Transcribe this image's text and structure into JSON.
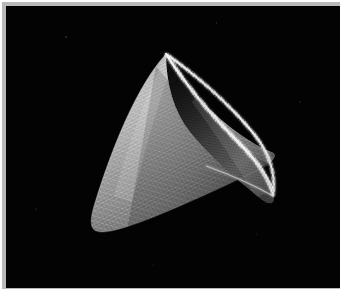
{
  "figure": {
    "background_color": "#030303",
    "plate_color": "#b9b9b9",
    "page_color": "#ffffff",
    "canvas": {
      "width": 334,
      "height": 282,
      "offset_x": 4,
      "offset_y": 4
    }
  },
  "object": {
    "name": "cone-mesh",
    "shading": "diffuse-lambert",
    "light_direction": "upper-left",
    "outer_surface": {
      "label": "outer-flank",
      "highlight_color": "#c9c9c9",
      "mid_color": "#8a8a8a",
      "shadow_color": "#3a3a3a"
    },
    "inner_surface": {
      "label": "inner-cavity",
      "highlight_color": "#6e6e6e",
      "mid_color": "#474747",
      "shadow_color": "#141414"
    },
    "rim": {
      "label": "elliptical-opening-rim",
      "color": "#e8e8e8",
      "style": "serrated-wireframe"
    },
    "geometry": {
      "apex_x": 160,
      "apex_y": 48,
      "lower_tip_x": 85,
      "lower_tip_y": 224,
      "right_tip_x": 266,
      "right_tip_y": 195,
      "rim_center_x": 213,
      "rim_center_y": 122,
      "rim_radius_x": 56,
      "rim_radius_y": 82,
      "rim_rotation_deg": 38
    },
    "mesh": {
      "type": "triangular-wireframe",
      "line_color": "#d6d6d6",
      "density": "fine"
    }
  }
}
